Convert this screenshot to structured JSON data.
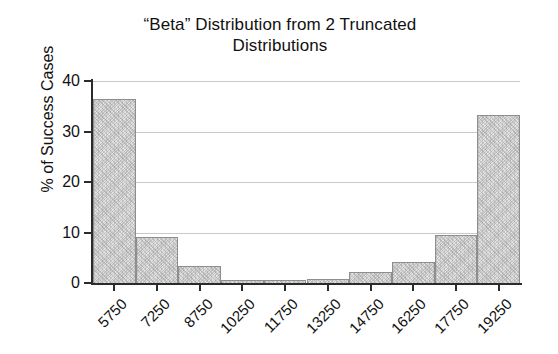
{
  "chart_data": {
    "type": "bar",
    "title": "“Beta” Distribution from 2 Truncated Distributions",
    "title_line1": "“Beta” Distribution from 2 Truncated",
    "title_line2": "Distributions",
    "xlabel": "",
    "ylabel": "% of Success Cases",
    "categories": [
      "5750",
      "7250",
      "8750",
      "10250",
      "11750",
      "13250",
      "14750",
      "16250",
      "17750",
      "19250"
    ],
    "values": [
      36.4,
      9.2,
      3.4,
      0.5,
      0.6,
      0.7,
      2.2,
      4.2,
      9.6,
      33.2
    ],
    "ylim": [
      0,
      40
    ],
    "yticks": [
      "0",
      "10",
      "20",
      "30",
      "40"
    ],
    "ytick_values": [
      0,
      10,
      20,
      30,
      40
    ],
    "grid": true,
    "grid_axis": "y",
    "legend": "none",
    "bar_fill_color": "#e3e3e3",
    "bar_edge_color": "#8e8e8e",
    "axis_color": "#2b2b2b",
    "gridline_color": "#c9c9c9",
    "xtick_rotation": -45,
    "bar_gap": 0
  }
}
